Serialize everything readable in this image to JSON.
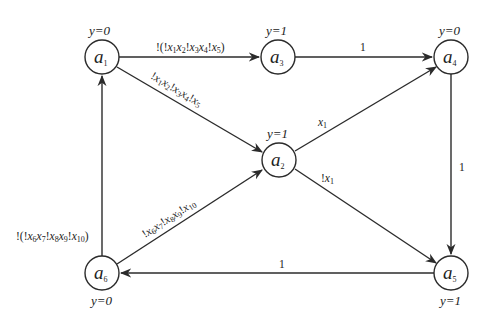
{
  "diagram": {
    "type": "state-transition-graph",
    "nodes": [
      {
        "id": "a1",
        "name": "a",
        "sub": "1",
        "output": "y=0",
        "cx": 102,
        "cy": 57
      },
      {
        "id": "a2",
        "name": "a",
        "sub": "2",
        "output": "y=1",
        "cx": 279,
        "cy": 160
      },
      {
        "id": "a3",
        "name": "a",
        "sub": "3",
        "output": "y=1",
        "cx": 278,
        "cy": 57
      },
      {
        "id": "a4",
        "name": "a",
        "sub": "4",
        "output": "y=0",
        "cx": 451,
        "cy": 57
      },
      {
        "id": "a5",
        "name": "a",
        "sub": "5",
        "output": "y=1",
        "cx": 451,
        "cy": 273
      },
      {
        "id": "a6",
        "name": "a",
        "sub": "6",
        "output": "y=0",
        "cx": 102,
        "cy": 273
      }
    ],
    "edges": [
      {
        "from": "a1",
        "to": "a3",
        "label": "!(!x1x2!x3x4!x5)"
      },
      {
        "from": "a1",
        "to": "a2",
        "label": "!x1x2!x3x4!x5"
      },
      {
        "from": "a3",
        "to": "a4",
        "label": "1"
      },
      {
        "from": "a2",
        "to": "a4",
        "label": "x1"
      },
      {
        "from": "a2",
        "to": "a5",
        "label": "!x1"
      },
      {
        "from": "a4",
        "to": "a5",
        "label": "1"
      },
      {
        "from": "a5",
        "to": "a6",
        "label": "1"
      },
      {
        "from": "a6",
        "to": "a2",
        "label": "!x6x7!x8x9!x10"
      },
      {
        "from": "a6",
        "to": "a1",
        "label": "!(!x6x7!x8x9!x10)"
      }
    ]
  },
  "labels": {
    "a1": {
      "name": "a",
      "sub": "1",
      "output": "y=0"
    },
    "a2": {
      "name": "a",
      "sub": "2",
      "output": "y=1"
    },
    "a3": {
      "name": "a",
      "sub": "3",
      "output": "y=1"
    },
    "a4": {
      "name": "a",
      "sub": "4",
      "output": "y=0"
    },
    "a5": {
      "name": "a",
      "sub": "5",
      "output": "y=1"
    },
    "a6": {
      "name": "a",
      "sub": "6",
      "output": "y=0"
    },
    "e_a3_a4": "1",
    "e_a4_a5": "1",
    "e_a5_a6": "1",
    "e_a2_a4": {
      "var": "x",
      "sub": "1"
    },
    "e_a2_a5": {
      "neg": "!",
      "var": "x",
      "sub": "1"
    }
  }
}
